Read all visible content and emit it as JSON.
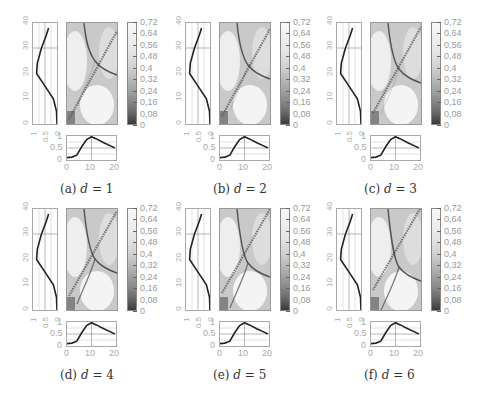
{
  "figure": {
    "panels": [
      {
        "id": "a",
        "caption_label": "(a)",
        "caption_var": "d",
        "caption_eq": "= 1",
        "left": 20,
        "top": 16
      },
      {
        "id": "b",
        "caption_label": "(b)",
        "caption_var": "d",
        "caption_eq": "= 2",
        "left": 173,
        "top": 16
      },
      {
        "id": "c",
        "caption_label": "(c)",
        "caption_var": "d",
        "caption_eq": "= 3",
        "left": 324,
        "top": 16
      },
      {
        "id": "d",
        "caption_label": "(d)",
        "caption_var": "d",
        "caption_eq": "= 4",
        "left": 20,
        "top": 202
      },
      {
        "id": "e",
        "caption_label": "(e)",
        "caption_var": "d",
        "caption_eq": "= 5",
        "left": 173,
        "top": 202
      },
      {
        "id": "f",
        "caption_label": "(f)",
        "caption_var": "d",
        "caption_eq": "= 6",
        "left": 324,
        "top": 202
      }
    ],
    "colorbar_ticks": [
      "0,72",
      "0,64",
      "0,56",
      "0,48",
      "0,4",
      "0,32",
      "0,24",
      "0,16",
      "0,08",
      "0"
    ],
    "left_plot_y_ticks": [
      "0",
      "10",
      "20",
      "30",
      "40"
    ],
    "left_plot_x_ticks": [
      "1",
      "0.5",
      "0"
    ],
    "bottom_plot_y_ticks": [
      "0",
      "0.5",
      "1"
    ],
    "bottom_plot_x_ticks": [
      "0",
      "10",
      "20"
    ]
  },
  "chart_data": [
    {
      "type": "heatmap",
      "title": "(a) d = 1",
      "colorbar": {
        "min": 0,
        "max": 0.72,
        "ticks": [
          0,
          0.08,
          0.16,
          0.24,
          0.32,
          0.4,
          0.48,
          0.56,
          0.64,
          0.72
        ]
      },
      "left_profile": {
        "type": "line",
        "y_range": [
          0,
          40
        ],
        "x_range": [
          1,
          0
        ],
        "x_ticks": [
          1,
          0.5,
          0
        ],
        "y_ticks": [
          0,
          10,
          20,
          30,
          40
        ],
        "points": [
          [
            0.0,
            0
          ],
          [
            0.02,
            5
          ],
          [
            0.15,
            10
          ],
          [
            0.5,
            15
          ],
          [
            0.85,
            20
          ],
          [
            0.82,
            24
          ],
          [
            0.65,
            30
          ],
          [
            0.45,
            35
          ],
          [
            0.35,
            38
          ]
        ]
      },
      "bottom_profile": {
        "type": "line",
        "x_range": [
          0,
          20
        ],
        "y_range": [
          0,
          1
        ],
        "x_ticks": [
          0,
          10,
          20
        ],
        "y_ticks": [
          0,
          0.5,
          1
        ],
        "points": [
          [
            0,
            0.1
          ],
          [
            2,
            0.12
          ],
          [
            4,
            0.2
          ],
          [
            6,
            0.55
          ],
          [
            8,
            0.85
          ],
          [
            10,
            0.97
          ],
          [
            12,
            0.88
          ],
          [
            15,
            0.72
          ],
          [
            18,
            0.58
          ],
          [
            19.5,
            0.5
          ]
        ]
      }
    },
    {
      "type": "heatmap",
      "title": "(b) d = 2",
      "colorbar": {
        "min": 0,
        "max": 0.72
      }
    },
    {
      "type": "heatmap",
      "title": "(c) d = 3",
      "colorbar": {
        "min": 0,
        "max": 0.72
      }
    },
    {
      "type": "heatmap",
      "title": "(d) d = 4",
      "colorbar": {
        "min": 0,
        "max": 0.72
      }
    },
    {
      "type": "heatmap",
      "title": "(e) d = 5",
      "colorbar": {
        "min": 0,
        "max": 0.72
      }
    },
    {
      "type": "heatmap",
      "title": "(f) d = 6",
      "colorbar": {
        "min": 0,
        "max": 0.72
      }
    }
  ]
}
